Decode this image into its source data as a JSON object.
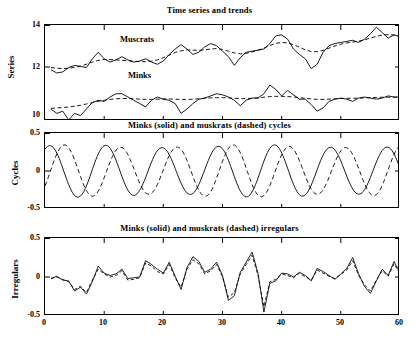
{
  "figure": {
    "width": 419,
    "height": 341,
    "background": "#ffffff",
    "ink": "#000000"
  },
  "axis": {
    "x_label": "",
    "x_ticks": [
      "0",
      "10",
      "20",
      "30",
      "40",
      "50",
      "60"
    ],
    "x_min": 0,
    "x_max": 60
  },
  "panels": [
    {
      "id": "series-trends",
      "title": "Time series and trends",
      "ylabel": "Series",
      "y_ticks": [
        "14",
        "12",
        "10"
      ],
      "annotations": [
        "Muscrats",
        "Minks"
      ]
    },
    {
      "id": "cycles",
      "title": "Minks (solid) and muskrats (dashed) cycles",
      "ylabel": "Cycles",
      "y_ticks": [
        "0.5",
        "0",
        "-0.5"
      ],
      "annotations": []
    },
    {
      "id": "irregulars",
      "title": "Minks (solid) and muskrats (dashed) irregulars",
      "ylabel": "Irregulars",
      "y_ticks": [
        "0.5",
        "0",
        "-0.5"
      ],
      "annotations": []
    }
  ],
  "chart_data": [
    {
      "type": "line",
      "id": "series-trends",
      "title": "Time series and trends",
      "xlabel": "",
      "ylabel": "Series",
      "xlim": [
        0,
        60
      ],
      "ylim": [
        10,
        14.4
      ],
      "yticks": [
        10,
        12,
        14
      ],
      "xticks": [
        0,
        10,
        20,
        30,
        40,
        50,
        60
      ],
      "grid": false,
      "legend": "inline-annotations",
      "annotations": [
        {
          "text": "Muscrats",
          "x": 17,
          "y": 13.55
        },
        {
          "text": "Minks",
          "x": 16,
          "y": 11.75
        }
      ],
      "x": [
        1,
        2,
        3,
        4,
        5,
        6,
        7,
        8,
        9,
        10,
        11,
        12,
        13,
        14,
        15,
        16,
        17,
        18,
        19,
        20,
        21,
        22,
        23,
        24,
        25,
        26,
        27,
        28,
        29,
        30,
        31,
        32,
        33,
        34,
        35,
        36,
        37,
        38,
        39,
        40,
        41,
        42,
        43,
        44,
        45,
        46,
        47,
        48,
        49,
        50,
        51,
        52,
        53,
        54,
        55,
        56,
        57,
        58,
        59,
        60
      ],
      "series": [
        {
          "name": "Muscrats",
          "style": "solid",
          "values": [
            12.35,
            12.2,
            12.25,
            12.45,
            12.55,
            12.5,
            12.45,
            12.85,
            13.15,
            12.85,
            12.7,
            12.8,
            12.95,
            12.8,
            12.7,
            12.75,
            12.85,
            12.7,
            12.6,
            12.75,
            13.05,
            13.3,
            13.5,
            13.3,
            13.05,
            13.15,
            13.4,
            13.55,
            13.45,
            13.2,
            12.95,
            12.55,
            12.9,
            13.15,
            13.2,
            13.25,
            13.3,
            13.55,
            13.9,
            13.95,
            13.75,
            13.3,
            13.05,
            12.85,
            12.4,
            12.6,
            13.15,
            13.45,
            13.55,
            13.6,
            13.65,
            13.7,
            13.6,
            13.75,
            14.0,
            14.3,
            14.05,
            13.8,
            13.95,
            13.85
          ]
        },
        {
          "name": "Muscrats trend",
          "style": "dashed",
          "values": [
            12.45,
            12.42,
            12.4,
            12.42,
            12.46,
            12.52,
            12.6,
            12.7,
            12.78,
            12.82,
            12.82,
            12.8,
            12.78,
            12.76,
            12.74,
            12.72,
            12.72,
            12.74,
            12.8,
            12.9,
            13.02,
            13.14,
            13.22,
            13.26,
            13.25,
            13.24,
            13.26,
            13.3,
            13.32,
            13.28,
            13.2,
            13.12,
            13.08,
            13.1,
            13.16,
            13.24,
            13.34,
            13.46,
            13.56,
            13.6,
            13.58,
            13.5,
            13.38,
            13.26,
            13.18,
            13.18,
            13.24,
            13.34,
            13.44,
            13.52,
            13.58,
            13.62,
            13.66,
            13.72,
            13.8,
            13.88,
            13.94,
            13.96,
            13.94,
            13.88
          ]
        },
        {
          "name": "Minks",
          "style": "solid",
          "values": [
            10.55,
            10.35,
            10.45,
            10.05,
            10.35,
            10.25,
            10.55,
            10.85,
            10.95,
            10.9,
            11.1,
            11.25,
            11.25,
            11.1,
            10.95,
            10.8,
            10.65,
            10.95,
            11.1,
            11.0,
            10.95,
            10.8,
            10.35,
            10.55,
            10.8,
            11.0,
            11.05,
            11.15,
            11.25,
            11.2,
            11.1,
            10.95,
            10.7,
            10.95,
            11.05,
            11.05,
            11.25,
            11.65,
            11.45,
            11.15,
            11.4,
            11.2,
            11.0,
            11.0,
            10.75,
            10.45,
            10.6,
            10.9,
            11.0,
            11.05,
            11.0,
            10.9,
            11.05,
            11.1,
            11.05,
            11.0,
            11.05,
            11.15,
            11.1,
            11.1
          ]
        },
        {
          "name": "Minks trend",
          "style": "dashed",
          "values": [
            10.58,
            10.6,
            10.62,
            10.64,
            10.68,
            10.72,
            10.78,
            10.84,
            10.9,
            10.95,
            10.99,
            11.02,
            11.03,
            11.03,
            11.02,
            11.0,
            10.99,
            10.99,
            11.0,
            11.01,
            11.01,
            11.0,
            10.99,
            10.99,
            11.0,
            11.02,
            11.04,
            11.06,
            11.07,
            11.07,
            11.06,
            11.04,
            11.03,
            11.03,
            11.04,
            11.06,
            11.09,
            11.12,
            11.13,
            11.13,
            11.12,
            11.1,
            11.07,
            11.04,
            11.01,
            10.99,
            10.99,
            11.0,
            11.02,
            11.03,
            11.04,
            11.04,
            11.05,
            11.06,
            11.07,
            11.08,
            11.09,
            11.09,
            11.09,
            11.09
          ]
        }
      ]
    },
    {
      "type": "line",
      "id": "cycles",
      "title": "Minks (solid) and muskrats (dashed) cycles",
      "xlabel": "",
      "ylabel": "Cycles",
      "xlim": [
        0,
        60
      ],
      "ylim": [
        -0.5,
        0.5
      ],
      "yticks": [
        -0.5,
        0,
        0.5
      ],
      "xticks": [
        0,
        10,
        20,
        30,
        40,
        50,
        60
      ],
      "grid": false,
      "legend": "in-title",
      "description": "Quasi-sinusoidal cycles, period approximately 9.5 time units, amplitude approximately 0.33. Muskrats (dashed) lead minks (solid) by roughly 2.5 units.",
      "series": [
        {
          "name": "Minks cycle",
          "style": "solid",
          "amplitude": 0.325,
          "period": 9.5,
          "phase_deg": 60
        },
        {
          "name": "Muskrats cycle",
          "style": "dashed",
          "amplitude": 0.325,
          "period": 9.5,
          "phase_deg": -35
        }
      ]
    },
    {
      "type": "line",
      "id": "irregulars",
      "title": "Minks (solid) and muskrats (dashed) irregulars",
      "xlabel": "",
      "ylabel": "Irregulars",
      "xlim": [
        0,
        60
      ],
      "ylim": [
        -0.5,
        0.5
      ],
      "yticks": [
        -0.5,
        0,
        0.5
      ],
      "xticks": [
        0,
        10,
        20,
        30,
        40,
        50,
        60
      ],
      "grid": false,
      "legend": "in-title",
      "x": [
        1,
        2,
        3,
        4,
        5,
        6,
        7,
        8,
        9,
        10,
        11,
        12,
        13,
        14,
        15,
        16,
        17,
        18,
        19,
        20,
        21,
        22,
        23,
        24,
        25,
        26,
        27,
        28,
        29,
        30,
        31,
        32,
        33,
        34,
        35,
        36,
        37,
        38,
        39,
        40,
        41,
        42,
        43,
        44,
        45,
        46,
        47,
        48,
        49,
        50,
        51,
        52,
        53,
        54,
        55,
        56,
        57,
        58,
        59,
        60
      ],
      "series": [
        {
          "name": "Minks irregular",
          "style": "solid",
          "values": [
            -0.02,
            0.01,
            -0.04,
            -0.05,
            -0.18,
            -0.13,
            -0.22,
            -0.06,
            0.14,
            0.05,
            0.02,
            0.04,
            0.1,
            -0.02,
            -0.01,
            0.0,
            0.21,
            0.16,
            0.1,
            0.05,
            0.19,
            0.01,
            -0.16,
            0.12,
            0.26,
            0.2,
            0.06,
            0.1,
            0.19,
            0.02,
            -0.3,
            -0.24,
            0.06,
            0.19,
            0.32,
            0.05,
            -0.45,
            -0.08,
            -0.05,
            0.05,
            0.04,
            0.0,
            0.06,
            0.02,
            -0.05,
            0.11,
            0.07,
            0.02,
            -0.03,
            0.04,
            0.11,
            0.25,
            0.04,
            -0.12,
            -0.21,
            -0.05,
            0.1,
            0.02,
            0.2,
            0.05
          ],
          "note": "Residual irregular component of minks series"
        },
        {
          "name": "Muskrats irregular",
          "style": "dashed",
          "values": [
            -0.02,
            0.0,
            -0.03,
            -0.06,
            -0.16,
            -0.12,
            -0.2,
            -0.04,
            0.1,
            0.04,
            0.0,
            0.02,
            0.08,
            -0.04,
            -0.03,
            -0.01,
            0.18,
            0.14,
            0.07,
            0.04,
            0.16,
            -0.01,
            -0.13,
            0.1,
            0.22,
            0.17,
            0.04,
            0.08,
            0.16,
            0.0,
            -0.26,
            -0.2,
            0.04,
            0.16,
            0.28,
            0.02,
            -0.38,
            -0.06,
            -0.03,
            0.04,
            0.02,
            -0.01,
            0.05,
            0.0,
            -0.04,
            0.09,
            0.05,
            0.01,
            -0.02,
            0.03,
            0.09,
            0.21,
            0.02,
            -0.1,
            -0.18,
            -0.04,
            0.08,
            0.01,
            0.17,
            0.04
          ],
          "note": "Residual irregular component of muskrats series"
        }
      ]
    }
  ]
}
